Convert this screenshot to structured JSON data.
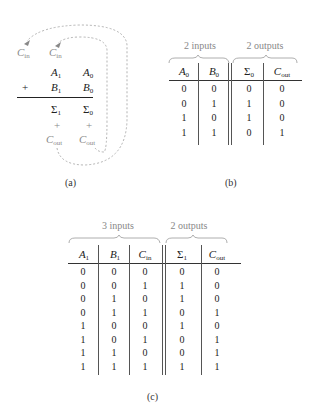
{
  "panel_a": {
    "carry_in_labels": [
      {
        "sym": "C",
        "sub": "in"
      },
      {
        "sym": "C",
        "sub": "in"
      }
    ],
    "row_a": [
      {
        "sym": "A",
        "sub": "1"
      },
      {
        "sym": "A",
        "sub": "0"
      }
    ],
    "plus_sign": "+",
    "row_b": [
      {
        "sym": "B",
        "sub": "1"
      },
      {
        "sym": "B",
        "sub": "0"
      }
    ],
    "row_sum": [
      {
        "sym": "Σ",
        "sub": "1"
      },
      {
        "sym": "Σ",
        "sub": "0"
      }
    ],
    "row_plus": [
      "+",
      "+"
    ],
    "row_cout": [
      {
        "sym": "C",
        "sub": "out"
      },
      {
        "sym": "C",
        "sub": "out"
      }
    ],
    "caption": "(a)"
  },
  "panel_b": {
    "group_inputs": "2 inputs",
    "group_outputs": "2 outputs",
    "headers": [
      {
        "sym": "A",
        "sub": "0"
      },
      {
        "sym": "B",
        "sub": "0"
      },
      {
        "sym": "Σ",
        "sub": "0"
      },
      {
        "sym": "C",
        "sub": "out"
      }
    ],
    "rows": [
      [
        "0",
        "0",
        "0",
        "0"
      ],
      [
        "0",
        "1",
        "1",
        "0"
      ],
      [
        "1",
        "0",
        "1",
        "0"
      ],
      [
        "1",
        "1",
        "0",
        "1"
      ]
    ],
    "caption": "(b)"
  },
  "panel_c": {
    "group_inputs": "3 inputs",
    "group_outputs": "2 outputs",
    "headers": [
      {
        "sym": "A",
        "sub": "1"
      },
      {
        "sym": "B",
        "sub": "1"
      },
      {
        "sym": "C",
        "sub": "in"
      },
      {
        "sym": "Σ",
        "sub": "1"
      },
      {
        "sym": "C",
        "sub": "out"
      }
    ],
    "rows": [
      [
        "0",
        "0",
        "0",
        "0",
        "0"
      ],
      [
        "0",
        "0",
        "1",
        "1",
        "0"
      ],
      [
        "0",
        "1",
        "0",
        "1",
        "0"
      ],
      [
        "0",
        "1",
        "1",
        "0",
        "1"
      ],
      [
        "1",
        "0",
        "0",
        "1",
        "0"
      ],
      [
        "1",
        "0",
        "1",
        "0",
        "1"
      ],
      [
        "1",
        "1",
        "0",
        "0",
        "1"
      ],
      [
        "1",
        "1",
        "1",
        "1",
        "1"
      ]
    ],
    "caption": "(c)"
  }
}
